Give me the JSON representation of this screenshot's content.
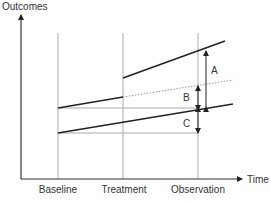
{
  "diagram": {
    "type": "difference-in-differences schematic",
    "y_axis_label": "Outcomes",
    "x_axis_label": "Time",
    "x_ticks": [
      "Baseline",
      "Treatment",
      "Observation"
    ],
    "difference_labels": [
      "A",
      "B",
      "C"
    ],
    "lines": [
      {
        "name": "treated-pre",
        "style": "solid",
        "from": "Baseline",
        "to": "Treatment"
      },
      {
        "name": "treated-post",
        "style": "solid",
        "from": "Treatment",
        "to": "end"
      },
      {
        "name": "counterfactual",
        "style": "dotted",
        "from": "Treatment",
        "to": "end"
      },
      {
        "name": "control",
        "style": "solid",
        "from": "Baseline",
        "to": "end"
      }
    ],
    "colors": {
      "axis": "#333333",
      "data_line": "#222222",
      "guide_line": "#aaaaaa",
      "dotted_line": "#999999"
    }
  }
}
